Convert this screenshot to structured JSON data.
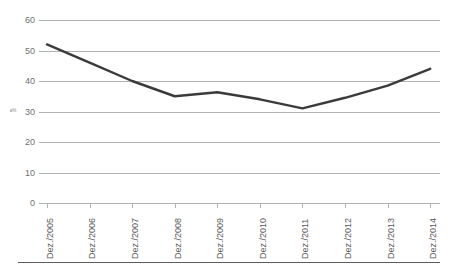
{
  "chart_data": {
    "type": "line",
    "title": "",
    "subtitle": "",
    "xlabel": "",
    "ylabel": "a%",
    "categories": [
      "Dez./2005",
      "Dez./2006",
      "Dez./2007",
      "Dez./2008",
      "Dez./2009",
      "Dez./2010",
      "Dez./2011",
      "Dez./2012",
      "Dez./2013",
      "Dez./2014"
    ],
    "values": [
      52,
      46,
      40,
      35,
      36.3,
      34,
      31,
      34.5,
      38.5,
      44
    ],
    "series": [
      {
        "name": "",
        "values": [
          52,
          46,
          40,
          35,
          36.3,
          34,
          31,
          34.5,
          38.5,
          44
        ]
      }
    ],
    "ylim": [
      0,
      60
    ],
    "yticks": [
      0,
      10,
      20,
      30,
      40,
      50,
      60
    ],
    "ytick_labels": [
      "0",
      "10",
      "20",
      "30",
      "40",
      "50",
      "60"
    ],
    "grid": true,
    "legend": false,
    "legend_position": "none",
    "line_color": "#3b3b3b",
    "grid_color": "#b2b2b2",
    "background_color": "#ffffff",
    "axis_text_color": "#5a5a5a"
  }
}
